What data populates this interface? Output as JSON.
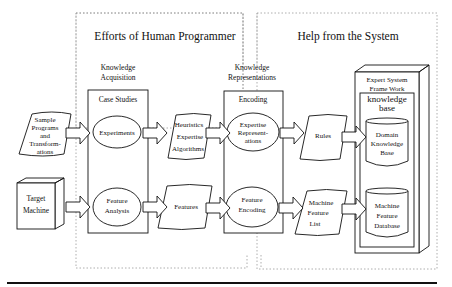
{
  "regions": {
    "human": "Efforts of Human Programmer",
    "system": "Help from the System"
  },
  "stages": {
    "acquisition": [
      "Knowledge",
      "Acquisition"
    ],
    "representation": [
      "Knowledge",
      "Representations"
    ]
  },
  "boxes": {
    "case_studies": "Case Studies",
    "encoding": "Encoding",
    "framework": [
      "Expert System",
      "Frame Work"
    ],
    "kb": [
      "knowledge",
      "base"
    ]
  },
  "inputs": {
    "samples": [
      "Sample",
      "Programs",
      "and",
      "Transform-",
      "ations"
    ],
    "target": [
      "Target",
      "Machine"
    ]
  },
  "processes": {
    "experiments": "Experiments",
    "feature_analysis": [
      "Feature",
      "Analysis"
    ],
    "expertise_rep": [
      "Expertise",
      "Represent-",
      "ations"
    ],
    "feature_encoding": [
      "Feature",
      "Encoding"
    ]
  },
  "documents": {
    "heuristics": [
      "Heuristics",
      "Expertise",
      "Algorithms"
    ],
    "features": "Features",
    "rules": "Rules",
    "mfl": [
      "Machine",
      "Feature",
      "List"
    ]
  },
  "databases": {
    "dkb": [
      "Domain",
      "Knowledge",
      "Base"
    ],
    "mfd": [
      "Machine",
      "Feature",
      "Database"
    ]
  }
}
